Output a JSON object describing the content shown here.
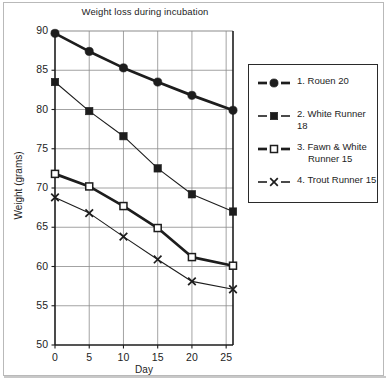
{
  "chart_data": {
    "type": "line",
    "title": "Weight loss during incubation",
    "xlabel": "Day",
    "ylabel": "Weight (grams)",
    "xlim": [
      0,
      26
    ],
    "ylim": [
      50,
      90
    ],
    "xticks": [
      0,
      5,
      10,
      15,
      20,
      25
    ],
    "yticks": [
      50,
      55,
      60,
      65,
      70,
      75,
      80,
      85,
      90
    ],
    "grid": true,
    "legend_position": "right",
    "x": [
      0,
      5,
      10,
      15,
      20,
      26
    ],
    "series": [
      {
        "name": "1. Rouen 20",
        "marker": "filled-circle",
        "line": "thick-solid",
        "values": [
          89.7,
          87.4,
          85.3,
          83.5,
          81.8,
          79.9
        ]
      },
      {
        "name": "2. White Runner 18",
        "marker": "filled-square",
        "line": "thin-solid",
        "values": [
          83.5,
          79.8,
          76.6,
          72.5,
          69.2,
          67.0
        ]
      },
      {
        "name": "3. Fawn & White Runner 15",
        "marker": "open-square",
        "line": "thick-solid",
        "values": [
          71.8,
          70.2,
          67.7,
          64.9,
          61.2,
          60.1
        ]
      },
      {
        "name": "4. Trout Runner 15",
        "marker": "cross-x",
        "line": "thin-solid",
        "values": [
          68.8,
          66.8,
          63.8,
          60.9,
          58.1,
          57.1
        ]
      }
    ],
    "colors": {
      "ink": "#1d1d1d",
      "grid": "#8c8c8c",
      "axis": "#1d1d1d",
      "frame": "#b9b9b9",
      "background": "#ffffff"
    }
  },
  "axis": {
    "y_tick_labels": [
      "90",
      "85",
      "80",
      "75",
      "70",
      "65",
      "60",
      "55",
      "50"
    ],
    "x_tick_labels": [
      "0",
      "5",
      "10",
      "15",
      "20",
      "25"
    ]
  },
  "legend": {
    "items": [
      {
        "label_line1": "1.  Rouen 20",
        "label_line2": ""
      },
      {
        "label_line1": "2.  White Runner 18",
        "label_line2": ""
      },
      {
        "label_line1": "3.  Fawn & White",
        "label_line2": "Runner 15"
      },
      {
        "label_line1": "4.  Trout Runner 15",
        "label_line2": ""
      }
    ]
  }
}
